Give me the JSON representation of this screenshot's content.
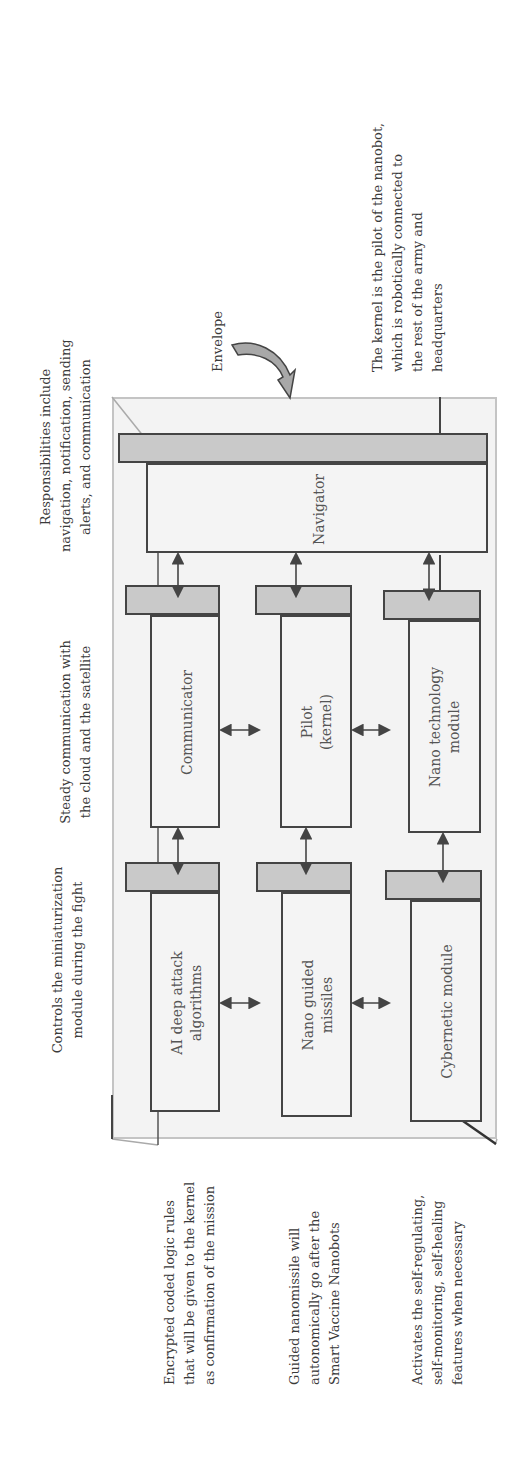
{
  "diagram": {
    "envelope_label": "Envelope",
    "modules": {
      "navigator": "Navigator",
      "communicator": "Communicator",
      "pilot": [
        "Pilot",
        "(kernel)"
      ],
      "nano_technology": [
        "Nano technology",
        "module"
      ],
      "ai_deep_attack": [
        "AI deep attack",
        "algorithms"
      ],
      "nano_guided_missiles": [
        "Nano guided",
        "missiles"
      ],
      "cybernetic": "Cybernetic module"
    },
    "annotations": {
      "navigator": [
        "Responsibilities include",
        "navigation, notification, sending",
        "alerts, and communication"
      ],
      "communicator": [
        "Steady communication with",
        "the cloud and the satellite"
      ],
      "ai_deep_attack": [
        "Controls the miniaturization",
        "module during the fight"
      ],
      "kernel": [
        "The kernel is the pilot of the nanobot,",
        "which is robotically connected to",
        "the rest of the army and",
        "headquarters"
      ],
      "encrypted": [
        "Encrypted coded logic rules",
        "that will be given to the kernel",
        "as confirmation of the mission"
      ],
      "guided": [
        "Guided nanomissile will",
        "autonomically go after the",
        "Smart Vaccine Nanobots"
      ],
      "cybernetic": [
        "Activates the self-regulating,",
        "self-monitoring, self-healing",
        "features when necessary"
      ]
    },
    "colors": {
      "envelope_fill": "#f3f3f3",
      "envelope_border": "#c4c4c4",
      "box_face": "#f4f4f4",
      "box_top": "#c9c9c9",
      "stroke": "#444444",
      "text": "#3a3a3a"
    }
  }
}
